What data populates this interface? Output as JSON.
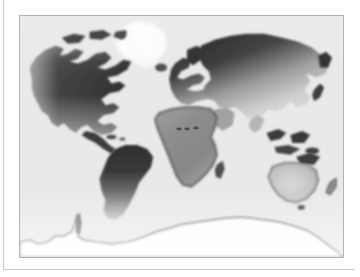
{
  "page": {
    "background_color": "#ffffff",
    "rule_color": "#c9c9c9"
  },
  "figure": {
    "type": "world-distribution-map",
    "projection": "equirectangular",
    "frame": {
      "border_color": "#b3b3b3",
      "ocean_color": "#e9e9e9",
      "x": 19,
      "y": 15,
      "width": 325,
      "height": 243
    },
    "legend_scale": {
      "description": "Grayscale intensity shading: dark = high value, light = low value",
      "dark_color": "#303030",
      "mid_color": "#8a8a8a",
      "light_color": "#dcdcdc",
      "highlight_color": "#ffffff"
    },
    "regions": [
      {
        "name": "North America",
        "shading": "dark-north-to-mid-south",
        "high_color": "#2e2e2e",
        "low_color": "#9a9a9a"
      },
      {
        "name": "Greenland",
        "shading": "bright-highlight",
        "high_color": "#ffffff",
        "low_color": "#f4f4f4"
      },
      {
        "name": "South America",
        "shading": "dark-north-to-light-south",
        "high_color": "#333333",
        "low_color": "#c4c4c4"
      },
      {
        "name": "Europe",
        "shading": "dark-north-to-mid-south",
        "high_color": "#3a3a3a",
        "low_color": "#9e9e9e"
      },
      {
        "name": "Africa",
        "shading": "mid-uniform-with-dark-edges",
        "high_color": "#6d6d6d",
        "low_color": "#a8a8a8"
      },
      {
        "name": "Asia",
        "shading": "dark-north-to-light-southeast",
        "high_color": "#2b2b2b",
        "low_color": "#c8c8c8"
      },
      {
        "name": "Australia",
        "shading": "light-with-dark-outline",
        "high_color": "#8e8e8e",
        "low_color": "#dedede"
      },
      {
        "name": "New Zealand",
        "shading": "mid",
        "high_color": "#8a8a8a",
        "low_color": "#bcbcbc"
      },
      {
        "name": "Madagascar",
        "shading": "dark",
        "high_color": "#4a4a4a",
        "low_color": "#6f6f6f"
      },
      {
        "name": "Antarctica",
        "shading": "white-with-dark-coastline",
        "high_color": "#ffffff",
        "low_color": "#ffffff"
      },
      {
        "name": "Japan",
        "shading": "dark",
        "high_color": "#3d3d3d",
        "low_color": "#5a5a5a"
      },
      {
        "name": "Indonesia",
        "shading": "dark",
        "high_color": "#3a3a3a",
        "low_color": "#6a6a6a"
      }
    ],
    "markers": [
      {
        "name": "sahara-marker-1",
        "x": 160,
        "y": 114,
        "color": "#4a4a4a"
      },
      {
        "name": "sahara-marker-2",
        "x": 168,
        "y": 114,
        "color": "#4a4a4a"
      },
      {
        "name": "sahara-marker-3",
        "x": 177,
        "y": 113,
        "color": "#4a4a4a"
      }
    ]
  }
}
